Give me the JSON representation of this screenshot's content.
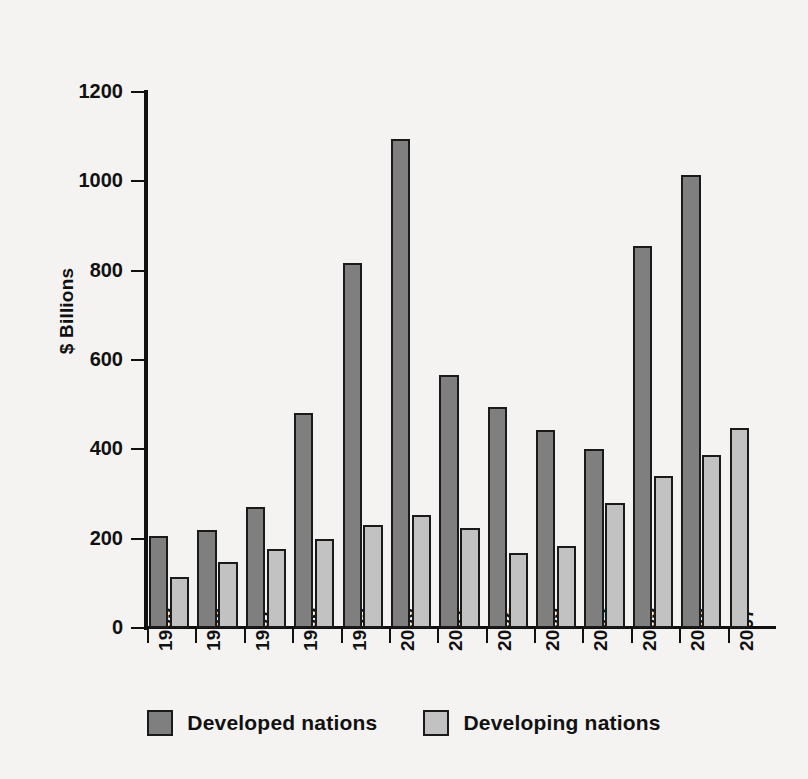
{
  "chart_data": {
    "type": "bar",
    "title": "",
    "xlabel": "",
    "ylabel": "$ Billions",
    "ylim": [
      0,
      1200
    ],
    "ytick_labels": [
      "1200",
      "1000",
      "800",
      "600",
      "400",
      "200",
      "0"
    ],
    "yticks": [
      1200,
      1000,
      800,
      600,
      400,
      200,
      0
    ],
    "grid": false,
    "legend_position": "bottom-center",
    "categories": [
      "1995",
      "1996",
      "1997",
      "1998",
      "1999",
      "2000",
      "2001",
      "2002",
      "2003",
      "2004",
      "2005",
      "2006"
    ],
    "axis_tick_labels": [
      "1995",
      "1996",
      "1997",
      "1998",
      "1999",
      "2000",
      "2001",
      "2002",
      "2003",
      "2004",
      "2005",
      "2006",
      "2007"
    ],
    "series": [
      {
        "name": "Developed nations",
        "color": "#7f7f7f",
        "values": [
          205,
          220,
          272,
          482,
          818,
          1095,
          567,
          495,
          443,
          400,
          855,
          1015
        ]
      },
      {
        "name": "Developing nations",
        "color": "#c2c2c2",
        "values": [
          115,
          147,
          176,
          199,
          231,
          254,
          225,
          168,
          183,
          280,
          341,
          387
        ]
      }
    ],
    "extra_bars": [
      {
        "series": "Developing nations",
        "category": "2007",
        "value": 448
      }
    ]
  },
  "legend": {
    "entries": [
      {
        "label": "Developed nations",
        "swatch": "developed"
      },
      {
        "label": "Developing nations",
        "swatch": "developing"
      }
    ]
  },
  "colors": {
    "developed": "#7f7f7f",
    "developing": "#c2c2c2",
    "axis": "#111111",
    "background": "#f4f3f1"
  }
}
